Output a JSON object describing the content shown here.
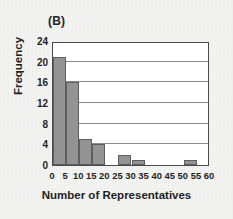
{
  "panel": {
    "label": "(B)"
  },
  "chart_data": {
    "type": "bar",
    "title": "",
    "subtitle": "",
    "panel_label": "(B)",
    "xlabel": "Number of Representatives",
    "ylabel": "Frequency",
    "categories": [
      "0-5",
      "5-10",
      "10-15",
      "15-20",
      "20-25",
      "25-30",
      "30-35",
      "35-40",
      "40-45",
      "45-50",
      "50-55",
      "55-60"
    ],
    "bin_starts": [
      0,
      5,
      10,
      15,
      20,
      25,
      30,
      35,
      40,
      45,
      50,
      55
    ],
    "bin_width": 5,
    "values": [
      21,
      16,
      5,
      4,
      0,
      2,
      1,
      0,
      0,
      0,
      1,
      0
    ],
    "xlim": [
      0,
      60
    ],
    "ylim": [
      0,
      24
    ],
    "xticks": [
      "0",
      "5",
      "10",
      "15",
      "20",
      "25",
      "30",
      "35",
      "40",
      "45",
      "50",
      "55",
      "60"
    ],
    "yticks": [
      "0",
      "4",
      "8",
      "12",
      "16",
      "20",
      "24"
    ],
    "grid": "horizontal",
    "legend": null,
    "colors": {
      "bar_fill": "#939393",
      "bar_edge": "#5e5e5e",
      "gridline": "#8a8a8a",
      "axis": "#4a4a4a",
      "plot_background": "#ffffff",
      "figure_background": "#f3f3f2",
      "text": "#1f1f1f"
    }
  }
}
